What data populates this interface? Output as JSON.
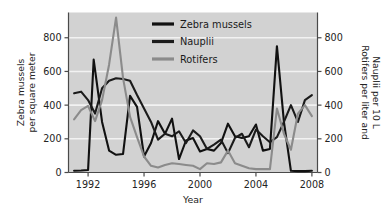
{
  "chart_data": {
    "type": "line",
    "title": "",
    "xlabel": "Year",
    "ylabel": "Zebra mussels per square meter",
    "y2label": "Rotifers per liter and Nauplii per 10 L",
    "xlim": [
      1990.6,
      2008.4
    ],
    "ylim": [
      0,
      950
    ],
    "y2lim": [
      0,
      950
    ],
    "grid": true,
    "grid_orientation": "horizontal",
    "legend_position": "top-center",
    "xticks": [
      1992,
      1996,
      2000,
      2004,
      2008
    ],
    "xtick_labels": [
      "1992",
      "1996",
      "2000",
      "2004",
      "2008"
    ],
    "yticks": [
      0,
      200,
      400,
      600,
      800
    ],
    "ytick_labels": [
      "0",
      "200",
      "400",
      "600",
      "800"
    ],
    "y2ticks": [
      0,
      200,
      400,
      600,
      800
    ],
    "y2tick_labels": [
      "0",
      "200",
      "400",
      "600",
      "800"
    ],
    "background": "#d2d2d2",
    "gridline_color": "#f2f2f2",
    "series": [
      {
        "name": "Zebra mussels",
        "color": "#111111",
        "axis": "left",
        "x": [
          1991,
          1991.5,
          1992,
          1992.4,
          1993,
          1993.5,
          1994,
          1994.5,
          1995,
          1995.5,
          1996,
          1996.5,
          1997,
          1997.5,
          1998,
          1998.5,
          1999,
          1999.5,
          2000,
          2000.5,
          2001,
          2001.5,
          2002,
          2002.5,
          2003,
          2003.5,
          2004,
          2004.5,
          2005,
          2005.5,
          2006,
          2006.5,
          2007,
          2007.5,
          2008
        ],
        "values": [
          10,
          12,
          15,
          670,
          300,
          130,
          105,
          110,
          455,
          390,
          95,
          175,
          305,
          230,
          320,
          80,
          190,
          205,
          125,
          140,
          130,
          175,
          290,
          215,
          205,
          215,
          285,
          130,
          140,
          750,
          300,
          10,
          8,
          8,
          10
        ]
      },
      {
        "name": "Nauplii",
        "color": "#1b1b1b",
        "axis": "right",
        "x": [
          1991,
          1991.5,
          1992,
          1992.5,
          1993,
          1993.5,
          1994,
          1994.5,
          1995,
          1995.5,
          1996,
          1996.5,
          1997,
          1997.5,
          1998,
          1998.5,
          1999,
          1999.5,
          2000,
          2000.5,
          2001,
          2001.5,
          2002,
          2002.5,
          2003,
          2003.5,
          2004,
          2004.5,
          2005,
          2005.5,
          2006,
          2006.5,
          2007,
          2007.5,
          2008
        ],
        "values": [
          470,
          480,
          430,
          350,
          500,
          545,
          560,
          555,
          545,
          460,
          380,
          300,
          195,
          230,
          215,
          245,
          175,
          250,
          215,
          140,
          165,
          195,
          115,
          205,
          230,
          150,
          255,
          215,
          180,
          210,
          300,
          400,
          300,
          430,
          460
        ]
      },
      {
        "name": "Rotifers",
        "color": "#8b8b8b",
        "axis": "right",
        "x": [
          1991,
          1991.5,
          1992,
          1992.5,
          1993,
          1993.5,
          1994,
          1994.5,
          1995,
          1995.5,
          1996,
          1996.5,
          1997,
          1997.5,
          1998,
          1998.5,
          1999,
          1999.5,
          2000,
          2000.5,
          2001,
          2001.5,
          2002,
          2002.5,
          2003,
          2003.5,
          2004,
          2004.5,
          2005,
          2005.5,
          2006,
          2006.5,
          2007,
          2007.5,
          2008
        ],
        "values": [
          315,
          370,
          395,
          305,
          430,
          640,
          920,
          560,
          330,
          210,
          95,
          40,
          30,
          45,
          55,
          50,
          45,
          40,
          20,
          55,
          50,
          60,
          130,
          55,
          40,
          25,
          20,
          20,
          20,
          380,
          230,
          135,
          350,
          400,
          335
        ]
      }
    ],
    "legend": [
      {
        "label": "Zebra mussels",
        "color": "#111111"
      },
      {
        "label": "Nauplii",
        "color": "#1b1b1b"
      },
      {
        "label": "Rotifers",
        "color": "#8b8b8b"
      }
    ]
  }
}
